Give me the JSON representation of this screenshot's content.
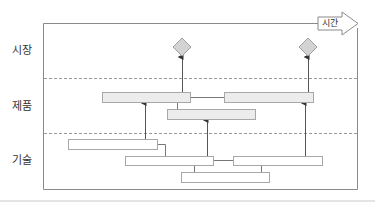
{
  "diagram": {
    "type": "roadmap",
    "time_axis_label": "시간",
    "lanes": [
      {
        "id": "market",
        "label": "시장"
      },
      {
        "id": "product",
        "label": "제품"
      },
      {
        "id": "technology",
        "label": "기술"
      }
    ],
    "colors": {
      "frame": "#8a8a8a",
      "product_fill": "#ececec",
      "tech_fill": "#ffffff",
      "box_border": "#a8a8a8",
      "diamond_fill": "#d3d3d3",
      "diamond_border": "#a0a0a0",
      "dashed_divider": "#9a9a9a",
      "arrow": "#555555"
    },
    "nodes": {
      "market": [
        {
          "shape": "diamond",
          "cx": 182,
          "cy": 47
        },
        {
          "shape": "diamond",
          "cx": 308,
          "cy": 47
        }
      ],
      "product": [
        {
          "shape": "bar",
          "x": 102,
          "y": 92,
          "w": 88,
          "h": 10
        },
        {
          "shape": "bar",
          "x": 224,
          "y": 92,
          "w": 89,
          "h": 10
        },
        {
          "shape": "bar",
          "x": 167,
          "y": 109,
          "w": 88,
          "h": 10
        }
      ],
      "technology": [
        {
          "shape": "bar",
          "x": 68,
          "y": 139,
          "w": 89,
          "h": 10
        },
        {
          "shape": "bar",
          "x": 125,
          "y": 156,
          "w": 88,
          "h": 9
        },
        {
          "shape": "bar",
          "x": 233,
          "y": 156,
          "w": 89,
          "h": 9
        },
        {
          "shape": "bar",
          "x": 181,
          "y": 172,
          "w": 88,
          "h": 10
        }
      ]
    }
  }
}
